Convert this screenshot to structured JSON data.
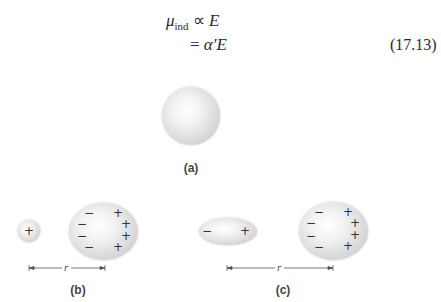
{
  "equation": {
    "line1": {
      "symbol": "μ",
      "subscript": "ind",
      "relation": "∝",
      "rhs": "E"
    },
    "line2": {
      "relation": "=",
      "rhs_coef": "α′",
      "rhs_var": "E"
    },
    "number": "(17.13)"
  },
  "figure": {
    "panels": [
      {
        "label": "(a)",
        "description": "neutral spherical atom"
      },
      {
        "label": "(b)",
        "description": "point charge + induces dipole in atom",
        "distance_label": "r",
        "small": {
          "signs": [
            "+"
          ]
        },
        "large": {
          "left_signs": [
            "−",
            "−",
            "−",
            "−"
          ],
          "right_signs": [
            "+",
            "+",
            "+",
            "+"
          ]
        }
      },
      {
        "label": "(c)",
        "description": "dipole induces dipole in atom",
        "distance_label": "r",
        "small": {
          "signs": [
            "−",
            "+"
          ]
        },
        "large": {
          "left_signs": [
            "−",
            "−",
            "−",
            "−"
          ],
          "right_signs": [
            "+",
            "+",
            "+",
            "+"
          ]
        }
      }
    ]
  }
}
